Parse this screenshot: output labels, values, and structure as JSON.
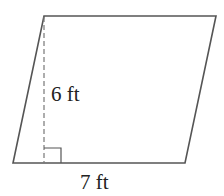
{
  "diagram": {
    "shape": "parallelogram",
    "vertices": {
      "top_left": [
        44,
        16
      ],
      "top_right": [
        216,
        16
      ],
      "bottom_right": [
        185,
        163
      ],
      "bottom_left": [
        13,
        163
      ]
    },
    "height_label": "6 ft",
    "base_label": "7 ft",
    "height_line": {
      "style": "dashed",
      "x": 44
    },
    "right_angle_marker": true,
    "colors": {
      "stroke": "#555555",
      "text": "#222222",
      "background": "#ffffff"
    }
  }
}
